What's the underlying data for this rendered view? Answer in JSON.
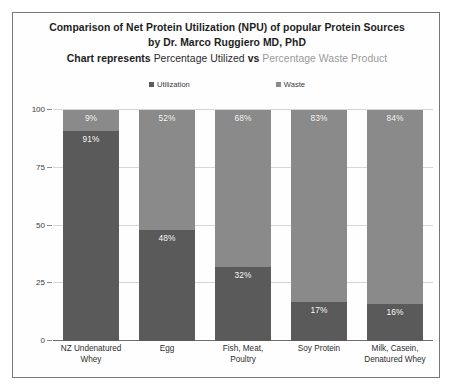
{
  "title": {
    "line1": "Comparison of Net Protein Utilization (NPU) of popular Protein Sources",
    "line2": "by Dr. Marco Ruggiero MD, PhD",
    "line3_part1": "Chart represents ",
    "line3_part2": "Percentage Utilized ",
    "line3_part3": "vs ",
    "line3_part4": "Percentage Waste Product"
  },
  "legend": {
    "items": [
      {
        "label": "Utilization",
        "color": "#5a5a5a",
        "icon": "square-marker-icon"
      },
      {
        "label": "Waste",
        "color": "#8a8a8a",
        "icon": "square-marker-icon"
      }
    ]
  },
  "axis": {
    "yticks": [
      "0",
      "25",
      "50",
      "75",
      "100"
    ]
  },
  "colors": {
    "utilization": "#5a5a5a",
    "waste": "#8a8a8a",
    "gridline": "#d6d6d6",
    "axis": "#6f6f6f",
    "faded_title": "#9a9a9a"
  },
  "chart_data": {
    "type": "bar",
    "title": "Comparison of Net Protein Utilization (NPU) of popular Protein Sources by Dr. Marco Ruggiero MD, PhD",
    "subtitle": "Chart represents Percentage Utilized vs Percentage Waste Product",
    "stacked": true,
    "xlabel": "",
    "ylabel": "",
    "ylim": [
      0,
      100
    ],
    "yticks": [
      0,
      25,
      50,
      75,
      100
    ],
    "grid": true,
    "legend_position": "top",
    "categories": [
      "NZ Undenatured Whey",
      "Egg",
      "Fish, Meat, Poultry",
      "Soy Protein",
      "Milk, Casein, Denatured Whey"
    ],
    "category_lines": [
      [
        "NZ Undenatured",
        "Whey"
      ],
      [
        "Egg"
      ],
      [
        "Fish, Meat,",
        "Poultry"
      ],
      [
        "Soy Protein"
      ],
      [
        "Milk, Casein,",
        "Denatured Whey"
      ]
    ],
    "series": [
      {
        "name": "Utilization",
        "color": "#5a5a5a",
        "values": [
          91,
          48,
          32,
          17,
          16
        ],
        "labels": [
          "91%",
          "48%",
          "32%",
          "17%",
          "16%"
        ]
      },
      {
        "name": "Waste",
        "color": "#8a8a8a",
        "values": [
          9,
          52,
          68,
          83,
          84
        ],
        "labels": [
          "9%",
          "52%",
          "68%",
          "83%",
          "84%"
        ]
      }
    ]
  }
}
